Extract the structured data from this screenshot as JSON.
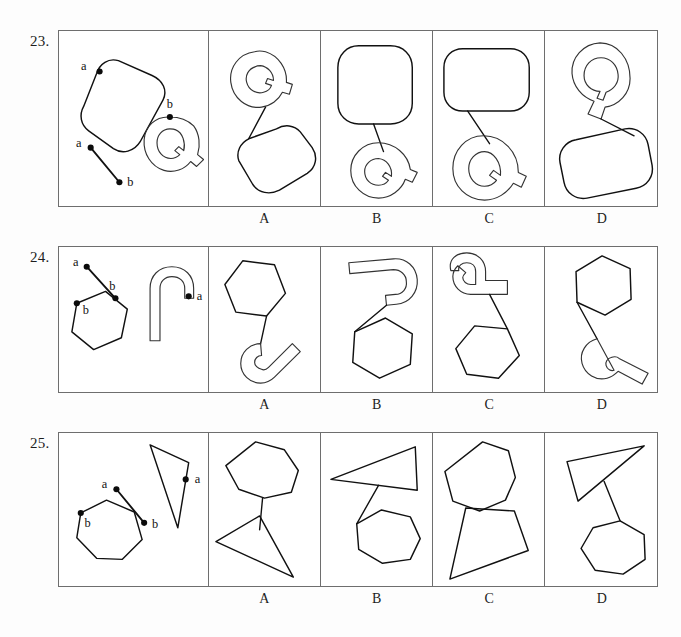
{
  "page": {
    "kind": "spatial-reasoning-test-page",
    "background_color": "#fdfdfd",
    "ink_color": "#111111",
    "border_color": "#6e6e6e"
  },
  "option_labels": [
    "A",
    "B",
    "C",
    "D"
  ],
  "items": [
    {
      "number": "23.",
      "point_labels": {
        "shape_a": "a",
        "shape_b": "b",
        "segment_a": "a",
        "segment_b": "b"
      },
      "prompt_description": "A rounded rectangle with marked point a, an outlined letter Q with a tail and marked point b, and a separate line segment with endpoints a and b.",
      "options": [
        {
          "label": "A",
          "description": "Q rotated, tail up-right, joined by a line to a rounded rectangle below-right."
        },
        {
          "label": "B",
          "description": "Upright rounded rectangle above joined by a line to a Q rotated with tail up-right below."
        },
        {
          "label": "C",
          "description": "Upright rounded rectangle above joined by a line to an upright Q with tail lower-right."
        },
        {
          "label": "D",
          "description": "Q above with tail pointing down, joined by a line to a rounded rectangle below-left."
        }
      ]
    },
    {
      "number": "24.",
      "point_labels": {
        "shape_a": "a",
        "shape_b": "b",
        "segment_a": "a",
        "segment_b": "b"
      },
      "prompt_description": "A hexagon with marked point b, a hook/arch shape with marked point a, and a separate line segment with endpoints a and b.",
      "options": [
        {
          "label": "A",
          "description": "Hexagon above joined by a line to a hook shape rotated opening up-right below."
        },
        {
          "label": "B",
          "description": "Hook shape above opening down-right, joined by a line to a hexagon below-right."
        },
        {
          "label": "C",
          "description": "Hook shape above opening right, joined by a line to a hexagon below-right."
        },
        {
          "label": "D",
          "description": "Hexagon above joined by a line to a hook shape below opening up-right."
        }
      ]
    },
    {
      "number": "25.",
      "point_labels": {
        "shape_a": "a",
        "shape_b": "b",
        "segment_a": "a",
        "segment_b": "b"
      },
      "prompt_description": "A heptagon with marked point b, a narrow triangle with marked point a, and a separate line segment with endpoints a and b.",
      "options": [
        {
          "label": "A",
          "description": "Heptagon above joined by a line to a narrow triangle below pointing lower-right."
        },
        {
          "label": "B",
          "description": "Narrow triangle above joined by a line to a heptagon below-right."
        },
        {
          "label": "C",
          "description": "Heptagon above joined directly to a narrow triangle pointing lower-left."
        },
        {
          "label": "D",
          "description": "Narrow triangle above joined by a line to a heptagon below-right."
        }
      ]
    }
  ]
}
